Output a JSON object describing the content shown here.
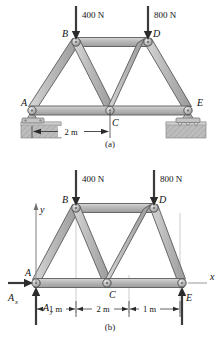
{
  "figure_a": {
    "caption": "(a)",
    "joint_labels": [
      "A",
      "B",
      "C",
      "D",
      "E"
    ],
    "loads": [
      {
        "label": "400 N",
        "at_joint": "B",
        "direction": "down"
      },
      {
        "label": "800 N",
        "at_joint": "D",
        "direction": "down"
      }
    ],
    "dimension": "2 m",
    "supports": [
      {
        "at_joint": "A",
        "type": "pin-on-ground-block"
      },
      {
        "at_joint": "E",
        "type": "rocker-on-ground-block"
      }
    ]
  },
  "figure_b": {
    "caption": "(b)",
    "joint_labels": [
      "A",
      "B",
      "C",
      "D",
      "E"
    ],
    "axis_labels": {
      "x": "x",
      "y": "y"
    },
    "loads": [
      {
        "label": "400 N",
        "at_joint": "B",
        "direction": "down"
      },
      {
        "label": "800 N",
        "at_joint": "D",
        "direction": "down"
      }
    ],
    "reactions": [
      {
        "label": "A",
        "subscript": "x",
        "direction": "left"
      },
      {
        "label": "A",
        "subscript": "y",
        "direction": "up"
      },
      {
        "label": "E",
        "subscript": "",
        "direction": "up"
      }
    ],
    "dimensions": [
      "1 m",
      "2 m",
      "1 m"
    ]
  },
  "colors": {
    "member_fill": "#b4b4b4",
    "member_fill_light": "#d2d2d2",
    "member_stroke": "#555555",
    "ground_fill": "#b8b8b8",
    "arrow": "#3a3a3a",
    "text": "#111111",
    "thin_line": "#9a9a9a"
  }
}
